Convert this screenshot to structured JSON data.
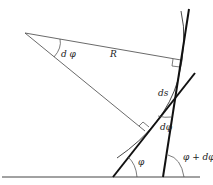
{
  "diagram": {
    "labels": {
      "center_angle": "d φ",
      "radius": "R",
      "arc_length": "ds",
      "tangent_angle_diff": "dφ",
      "tangent_angle_1": "φ",
      "tangent_angle_2": "φ + dφ"
    },
    "colors": {
      "line": "#222222",
      "thin_line": "#444444",
      "background": "#ffffff"
    }
  }
}
